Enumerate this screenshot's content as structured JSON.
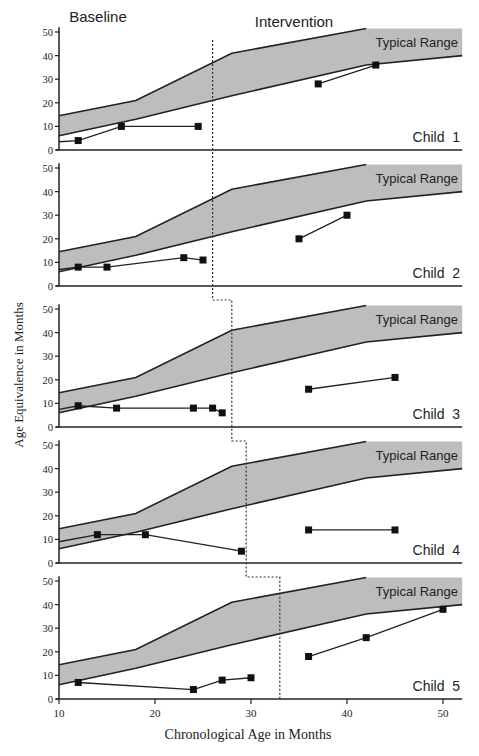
{
  "headers": {
    "baseline": "Baseline",
    "intervention": "Intervention"
  },
  "axes": {
    "xlabel": "Chronological Age in Months",
    "ylabel": "Age Equivalence in Months",
    "xticks": [
      10,
      20,
      30,
      40,
      50
    ],
    "yticks": [
      0,
      10,
      20,
      30,
      40,
      50
    ],
    "xlim": [
      10,
      52
    ],
    "ylim": [
      0,
      50
    ]
  },
  "typical_range_label": "Typical Range",
  "colors": {
    "band": "#bdbdbd",
    "line": "#222222",
    "marker": "#111111"
  },
  "chart_data": {
    "type": "line",
    "title": "",
    "xlabel": "Chronological Age in Months",
    "ylabel": "Age Equivalence in Months",
    "xlim": [
      10,
      52
    ],
    "ylim": [
      0,
      50
    ],
    "grid": false,
    "typical_range": {
      "label": "Typical Range",
      "upper": [
        [
          10,
          14.5
        ],
        [
          18,
          21
        ],
        [
          28,
          41
        ],
        [
          42,
          51.5
        ],
        [
          52,
          51.5
        ]
      ],
      "lower": [
        [
          10,
          6
        ],
        [
          18,
          13
        ],
        [
          28,
          23
        ],
        [
          42,
          36
        ],
        [
          52,
          40
        ]
      ]
    },
    "panels": [
      {
        "label": "Child 1",
        "phase_change_x": 26,
        "baseline": [
          [
            12,
            4
          ],
          [
            16.5,
            10
          ],
          [
            24.5,
            10
          ]
        ],
        "baseline_start": [
          [
            10,
            3.5
          ]
        ],
        "intervention": [
          [
            37,
            28
          ],
          [
            43,
            36
          ]
        ]
      },
      {
        "label": "Child 2",
        "phase_change_x": 26,
        "baseline": [
          [
            12,
            8
          ],
          [
            15,
            8
          ],
          [
            23,
            12
          ],
          [
            25,
            11
          ]
        ],
        "baseline_start": [
          [
            10,
            7
          ]
        ],
        "intervention": [
          [
            35,
            20
          ],
          [
            40,
            30
          ]
        ]
      },
      {
        "label": "Child 3",
        "phase_change_x": 28,
        "baseline": [
          [
            12,
            9
          ],
          [
            16,
            8
          ],
          [
            24,
            8
          ],
          [
            26,
            8
          ],
          [
            27,
            6
          ]
        ],
        "baseline_start": [
          [
            10,
            7.5
          ]
        ],
        "intervention": [
          [
            36,
            16
          ],
          [
            45,
            21
          ]
        ]
      },
      {
        "label": "Child 4",
        "phase_change_x": 29.5,
        "baseline": [
          [
            14,
            12
          ],
          [
            19,
            12
          ],
          [
            29,
            5
          ]
        ],
        "baseline_start": [
          [
            10,
            9
          ]
        ],
        "intervention": [
          [
            36,
            14
          ],
          [
            45,
            14
          ]
        ]
      },
      {
        "label": "Child 5",
        "phase_change_x": 33,
        "baseline": [
          [
            12,
            7
          ],
          [
            24,
            4
          ],
          [
            27,
            8
          ],
          [
            30,
            9
          ]
        ],
        "baseline_start": [],
        "intervention": [
          [
            36,
            18
          ],
          [
            42,
            26
          ],
          [
            50,
            38
          ]
        ]
      }
    ]
  }
}
